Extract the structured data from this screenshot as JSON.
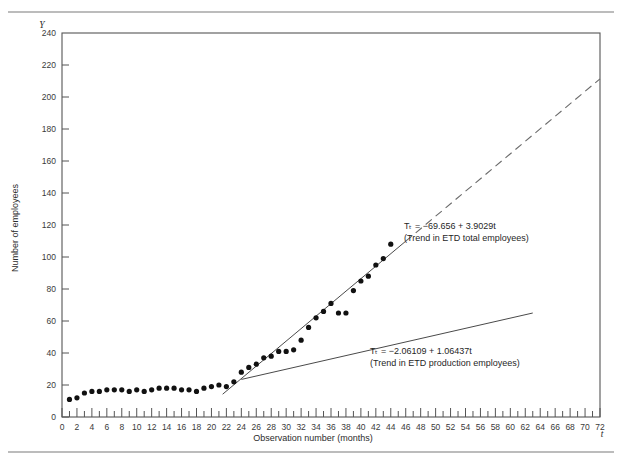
{
  "figure": {
    "y_axis_symbol": "Y",
    "x_axis_symbol": "t",
    "ylabel": "Number of employees",
    "xlabel": "Observation number (months)",
    "has_top_rule": true,
    "has_bottom_rule": true
  },
  "annotations": {
    "total": {
      "line1": "Tₜ  =  −69.656  +  3.9029t",
      "line2": "(Trend in ETD total employees)",
      "x": 404,
      "y": 229
    },
    "production": {
      "line1": "Tₜ  =  −2.06109  +  1.06437t",
      "line2": "(Trend in ETD production employees)",
      "x": 370,
      "y": 354
    }
  },
  "chart_data": {
    "type": "scatter",
    "title": "",
    "xlabel": "Observation number (months)",
    "ylabel": "Number of employees",
    "xlim": [
      0,
      72
    ],
    "ylim": [
      0,
      240
    ],
    "xticks": [
      0,
      2,
      4,
      6,
      8,
      10,
      12,
      14,
      16,
      18,
      20,
      22,
      24,
      26,
      28,
      30,
      32,
      34,
      36,
      38,
      40,
      42,
      44,
      46,
      48,
      50,
      52,
      54,
      56,
      58,
      60,
      62,
      64,
      66,
      68,
      70,
      72
    ],
    "xtick_minor_step": 1,
    "yticks": [
      0,
      20,
      40,
      60,
      80,
      100,
      120,
      140,
      160,
      180,
      200,
      220,
      240
    ],
    "grid": false,
    "legend": "none",
    "series": [
      {
        "name": "ETD total employees",
        "type": "scatter",
        "marker": "filled-circle",
        "color": "#111111",
        "x": [
          1,
          2,
          3,
          4,
          5,
          6,
          7,
          8,
          9,
          10,
          11,
          12,
          13,
          14,
          15,
          16,
          17,
          18,
          19,
          20,
          21,
          22,
          23,
          24,
          25,
          26,
          27,
          28,
          29,
          30,
          31,
          32,
          33,
          34,
          35,
          36,
          37,
          38,
          39,
          40,
          41,
          42,
          43,
          44
        ],
        "y": [
          11,
          12,
          15,
          16,
          16,
          17,
          17,
          17,
          16,
          17,
          16,
          17,
          18,
          18,
          18,
          17,
          17,
          16,
          18,
          19,
          20,
          19,
          22,
          28,
          31,
          33,
          37,
          38,
          41,
          41,
          42,
          48,
          56,
          62,
          66,
          71,
          65,
          65,
          79,
          85,
          88,
          95,
          99,
          108
        ]
      },
      {
        "name": "Trend in ETD total employees (fitted)",
        "type": "line",
        "style": "solid",
        "color": "#4a4a4a",
        "equation": "T_t = -69.656 + 3.9029t",
        "intercept": -69.656,
        "slope": 3.9029,
        "x_range": [
          21.5,
          46
        ]
      },
      {
        "name": "Trend in ETD total employees (extrapolated)",
        "type": "line",
        "style": "dashed",
        "color": "#6a6a6a",
        "equation": "T_t = -69.656 + 3.9029t",
        "intercept": -69.656,
        "slope": 3.9029,
        "x_range": [
          46,
          72
        ]
      },
      {
        "name": "Trend in ETD production employees",
        "type": "line",
        "style": "solid",
        "color": "#4a4a4a",
        "equation": "T_t = -2.06109 + 1.06437t",
        "intercept": -2.06109,
        "slope": 1.06437,
        "x_range": [
          24,
          63
        ]
      }
    ]
  }
}
